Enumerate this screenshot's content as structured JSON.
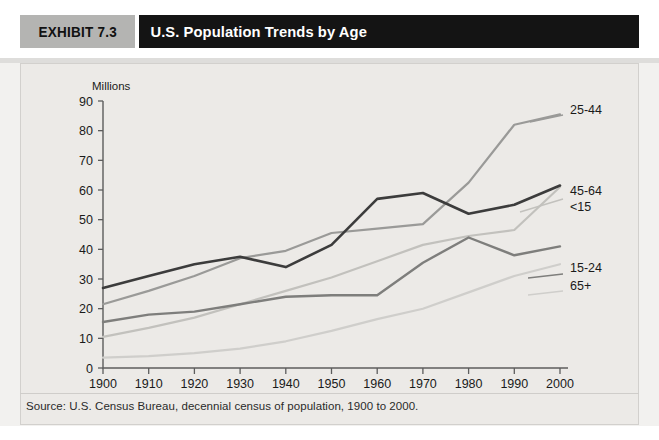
{
  "header": {
    "exhibit_label": "EXHIBIT 7.3",
    "title": "U.S. Population Trends by Age",
    "badge_color": "#b4b4b2",
    "title_bar_color": "#141414"
  },
  "source_note": "Source: U.S. Census Bureau, decennial census of population, 1900 to 2000.",
  "chart_data": {
    "type": "line",
    "title": "U.S. Population Trends by Age",
    "xlabel": "",
    "ylabel": "Millions",
    "y_axis_unit_label": "Millions",
    "xlim": [
      1900,
      2000
    ],
    "ylim": [
      0,
      90
    ],
    "ytick_step": 10,
    "xtick_step": 10,
    "grid": false,
    "legend_position": "right-inline-labels",
    "categories": [
      1900,
      1910,
      1920,
      1930,
      1940,
      1950,
      1960,
      1970,
      1980,
      1990,
      2000
    ],
    "xtick_labels": [
      "1900",
      "1910",
      "1920",
      "1930",
      "1940",
      "1950",
      "1960",
      "1970",
      "1980",
      "1990",
      "2000"
    ],
    "ytick_labels": [
      "0",
      "10",
      "20",
      "30",
      "40",
      "50",
      "60",
      "70",
      "80",
      "90"
    ],
    "series": [
      {
        "name": "<15",
        "label": "<15",
        "color": "#3c3c3c",
        "width": 2.6,
        "values": [
          27,
          31,
          35,
          37.5,
          34,
          41.5,
          57,
          59,
          52,
          55,
          61.5
        ]
      },
      {
        "name": "25-44",
        "label": "25-44",
        "color": "#9a9a98",
        "width": 2.2,
        "values": [
          21.5,
          26,
          31,
          37,
          39.5,
          45.5,
          47,
          48.5,
          62.5,
          82,
          85.5
        ]
      },
      {
        "name": "45-64",
        "label": "45-64",
        "color": "#c2c1bd",
        "width": 2.2,
        "values": [
          10.5,
          13.5,
          17,
          21.5,
          26,
          30.5,
          36,
          41.5,
          44.5,
          46.5,
          61
        ]
      },
      {
        "name": "15-24",
        "label": "15-24",
        "color": "#7e7e7c",
        "width": 2.4,
        "values": [
          15.5,
          18,
          19,
          21.5,
          24,
          24.5,
          24.5,
          35.5,
          44,
          38,
          41
        ]
      },
      {
        "name": "65+",
        "label": "65+",
        "color": "#cfcecb",
        "width": 2.2,
        "values": [
          3.5,
          4,
          5,
          6.5,
          9,
          12.5,
          16.5,
          20,
          25.5,
          31,
          35
        ]
      }
    ],
    "series_labels_right": [
      {
        "text": "25-44",
        "value_at_2000": 85.5
      },
      {
        "text": "45-64",
        "value_at_2000": 61
      },
      {
        "text": "<15",
        "value_at_2000": 61.5
      },
      {
        "text": "15-24",
        "value_at_2000": 41
      },
      {
        "text": "65+",
        "value_at_2000": 35
      }
    ]
  }
}
